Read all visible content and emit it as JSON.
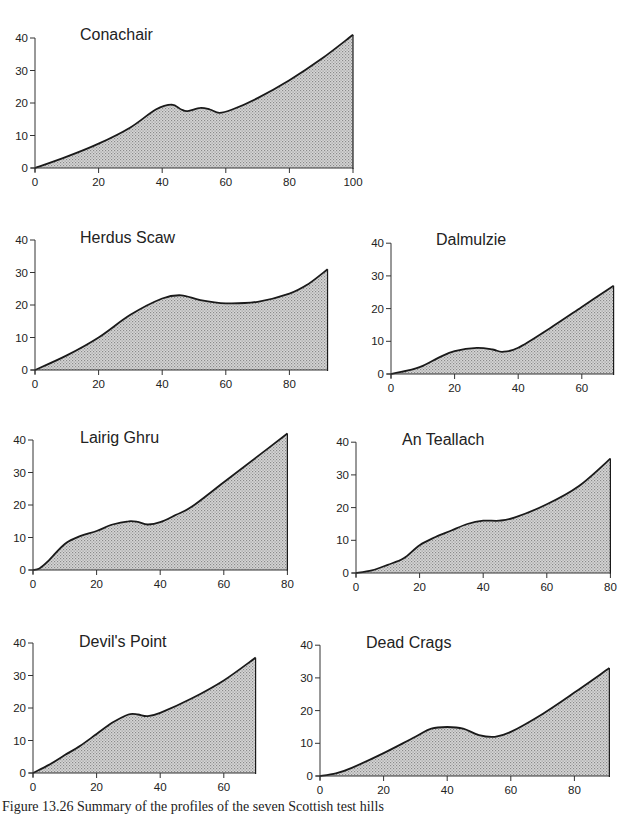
{
  "figure": {
    "caption": "Figure 13.26 Summary of the profiles of the seven Scottish test hills",
    "fill_color": "#c8c8c8",
    "line_color": "#1a1a1a"
  },
  "chart_data": [
    {
      "type": "area",
      "title": "Conachair",
      "xlabel": "",
      "ylabel": "",
      "xlim": [
        0,
        100
      ],
      "ylim": [
        0,
        40
      ],
      "xticks": [
        0,
        20,
        40,
        60,
        80,
        100
      ],
      "yticks": [
        0,
        10,
        20,
        30,
        40
      ],
      "grid": false,
      "x": [
        0,
        10,
        20,
        30,
        38,
        43,
        46,
        48,
        52,
        55,
        58,
        62,
        70,
        80,
        90,
        100
      ],
      "y": [
        0,
        3.5,
        7.5,
        12.5,
        18,
        19.5,
        18,
        17.5,
        18.5,
        18,
        17,
        18,
        21.5,
        27,
        33.5,
        41
      ],
      "layout": {
        "ox": 35,
        "oy": 168,
        "sx": 3.18,
        "sy": 3.25,
        "title_x": 80,
        "title_y": 40
      }
    },
    {
      "type": "area",
      "title": "Herdus Scaw",
      "xlabel": "",
      "ylabel": "",
      "xlim": [
        0,
        92
      ],
      "ylim": [
        0,
        40
      ],
      "xticks": [
        0,
        20,
        40,
        60,
        80
      ],
      "yticks": [
        0,
        10,
        20,
        30,
        40
      ],
      "grid": false,
      "x": [
        0,
        10,
        20,
        30,
        40,
        46,
        52,
        60,
        70,
        80,
        86,
        92
      ],
      "y": [
        0,
        4.5,
        10,
        17,
        22,
        23,
        21.5,
        20.5,
        21,
        23.5,
        26.5,
        31
      ],
      "layout": {
        "ox": 35,
        "oy": 370,
        "sx": 3.18,
        "sy": 3.25,
        "title_x": 80,
        "title_y": 243
      }
    },
    {
      "type": "area",
      "title": "Dalmulzie",
      "xlabel": "",
      "ylabel": "",
      "xlim": [
        0,
        70
      ],
      "ylim": [
        0,
        40
      ],
      "xticks": [
        0,
        20,
        40,
        60
      ],
      "yticks": [
        0,
        10,
        20,
        30,
        40
      ],
      "grid": false,
      "x": [
        0,
        5,
        10,
        15,
        20,
        27,
        32,
        35,
        40,
        50,
        60,
        70
      ],
      "y": [
        0,
        1,
        2.5,
        5,
        7,
        8,
        7.5,
        6.8,
        8,
        14,
        20.5,
        27
      ],
      "layout": {
        "ox": 391,
        "oy": 374,
        "sx": 3.18,
        "sy": 3.27,
        "title_x": 436,
        "title_y": 245
      }
    },
    {
      "type": "area",
      "title": "Lairig Ghru",
      "xlabel": "",
      "ylabel": "",
      "xlim": [
        0,
        80
      ],
      "ylim": [
        0,
        40
      ],
      "xticks": [
        0,
        20,
        40,
        60,
        80
      ],
      "yticks": [
        0,
        10,
        20,
        30,
        40
      ],
      "grid": false,
      "x": [
        0,
        2,
        5,
        10,
        15,
        20,
        25,
        30,
        33,
        36,
        40,
        45,
        50,
        60,
        70,
        80
      ],
      "y": [
        0,
        0.5,
        3,
        8,
        10.5,
        12,
        14,
        15,
        14.8,
        14,
        14.7,
        17,
        19.5,
        27,
        34.5,
        42
      ],
      "layout": {
        "ox": 33,
        "oy": 570,
        "sx": 3.18,
        "sy": 3.25,
        "title_x": 80,
        "title_y": 443
      }
    },
    {
      "type": "area",
      "title": "An Teallach",
      "xlabel": "",
      "ylabel": "",
      "xlim": [
        0,
        80
      ],
      "ylim": [
        0,
        40
      ],
      "xticks": [
        0,
        20,
        40,
        60,
        80
      ],
      "yticks": [
        0,
        10,
        20,
        30,
        40
      ],
      "grid": false,
      "x": [
        0,
        5,
        10,
        15,
        20,
        25,
        30,
        35,
        40,
        45,
        50,
        60,
        70,
        80
      ],
      "y": [
        0,
        0.8,
        2.5,
        4.5,
        8.5,
        11,
        13,
        15,
        16,
        16,
        17,
        21,
        26.5,
        35
      ],
      "layout": {
        "ox": 356,
        "oy": 573,
        "sx": 3.18,
        "sy": 3.27,
        "title_x": 402,
        "title_y": 445
      }
    },
    {
      "type": "area",
      "title": "Devil's Point",
      "xlabel": "",
      "ylabel": "",
      "xlim": [
        0,
        70
      ],
      "ylim": [
        0,
        40
      ],
      "xticks": [
        0,
        20,
        40,
        60
      ],
      "yticks": [
        0,
        10,
        20,
        30,
        40
      ],
      "grid": false,
      "x": [
        0,
        5,
        10,
        15,
        20,
        25,
        30,
        33,
        36,
        40,
        50,
        60,
        70
      ],
      "y": [
        0,
        2.5,
        5.5,
        8.5,
        12,
        15.5,
        18,
        18,
        17.5,
        18.5,
        23,
        28.5,
        35.5
      ],
      "layout": {
        "ox": 33,
        "oy": 773,
        "sx": 3.18,
        "sy": 3.25,
        "title_x": 79,
        "title_y": 647
      }
    },
    {
      "type": "area",
      "title": "Dead Crags",
      "xlabel": "",
      "ylabel": "",
      "xlim": [
        0,
        91
      ],
      "ylim": [
        0,
        40
      ],
      "xticks": [
        0,
        20,
        40,
        60,
        80
      ],
      "yticks": [
        0,
        10,
        20,
        30,
        40
      ],
      "grid": false,
      "x": [
        0,
        5,
        10,
        20,
        30,
        35,
        40,
        45,
        50,
        55,
        60,
        70,
        80,
        91
      ],
      "y": [
        0,
        0.8,
        2.5,
        7,
        12,
        14.5,
        15,
        14.5,
        12.5,
        12,
        13.5,
        19,
        25.5,
        33
      ],
      "layout": {
        "ox": 320,
        "oy": 776,
        "sx": 3.18,
        "sy": 3.27,
        "title_x": 366,
        "title_y": 648
      }
    }
  ]
}
